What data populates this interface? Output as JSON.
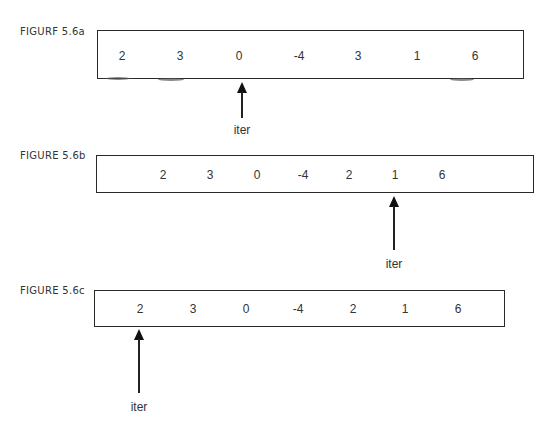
{
  "figures": [
    {
      "label": "FIGURF 5.6a",
      "values": [
        "2",
        "3",
        "0",
        "-4",
        "3",
        "1",
        "6"
      ],
      "iterator": {
        "label": "iter",
        "points_to_index": 2
      }
    },
    {
      "label": "FIGURE 5.6b",
      "values": [
        "2",
        "3",
        "0",
        "-4",
        "2",
        "1",
        "6"
      ],
      "iterator": {
        "label": "iter",
        "points_to_index": 5
      }
    },
    {
      "label": "FIGURE 5.6c",
      "values": [
        "2",
        "3",
        "0",
        "-4",
        "2",
        "1",
        "6"
      ],
      "iterator": {
        "label": "iter",
        "points_to_index": 0
      }
    }
  ]
}
